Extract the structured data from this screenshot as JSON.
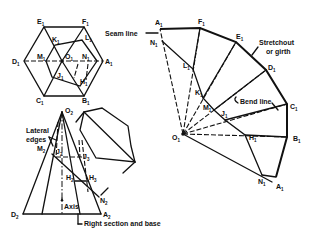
{
  "figure": {
    "top_view": {
      "vertices": [
        "A1",
        "B1",
        "C1",
        "D1",
        "E1",
        "F1"
      ],
      "center": "O1",
      "cut_points": [
        "H1",
        "J1",
        "K1",
        "L1",
        "M1",
        "N1"
      ]
    },
    "front_view": {
      "apex": "O2",
      "base_left": "D2",
      "base_right": "A2",
      "points": [
        "M2",
        "J2",
        "J3",
        "H2",
        "H3",
        "N2"
      ],
      "annotations": {
        "lateral_edges": "Lateral edges",
        "axis": "Axis",
        "right_section": "Right section and base"
      }
    },
    "development": {
      "apex": "O1",
      "arc_points": [
        "A1",
        "F1",
        "E1",
        "D1",
        "C1",
        "B1",
        "A1"
      ],
      "cut_points": [
        "N1",
        "L1",
        "K1",
        "M1",
        "J1",
        "H1",
        "N1"
      ],
      "annotations": {
        "seam_line": "Seam line",
        "stretchout_line1": "Stretchout",
        "stretchout_line2": "or girth",
        "bend_line": "Bend line"
      }
    }
  },
  "labels": {
    "top": {
      "E": "E",
      "E_sub": "1",
      "F": "F",
      "F_sub": "1",
      "K": "K",
      "K_sub": "1",
      "L": "L",
      "L_sub": "1",
      "M": "M",
      "M_sub": "1",
      "O": "O",
      "O_sub": "1",
      "N": "N",
      "N_sub": "1",
      "D": "D",
      "D_sub": "1",
      "A": "A",
      "A_sub": "1",
      "J": "J",
      "J_sub": "1",
      "H": "H",
      "H_sub": "1",
      "C": "C",
      "C_sub": "1",
      "B": "B",
      "B_sub": "1"
    },
    "front": {
      "O": "O",
      "O_sub": "2",
      "M": "M",
      "M_sub": "2",
      "J2": "J",
      "J2_sub": "2",
      "J3": "J",
      "J3_sub": "3",
      "H2": "H",
      "H2_sub": "2",
      "H3": "H",
      "H3_sub": "3",
      "N": "N",
      "N_sub": "2",
      "D": "D",
      "D_sub": "2",
      "A": "A",
      "A_sub": "2",
      "lateral1": "Lateral",
      "lateral2": "edges",
      "axis": "Axis",
      "right_section": "Right section and base"
    },
    "dev": {
      "A_top": "A",
      "A_top_sub": "1",
      "F": "F",
      "F_sub": "1",
      "E": "E",
      "E_sub": "1",
      "D": "D",
      "D_sub": "1",
      "C": "C",
      "C_sub": "1",
      "B": "B",
      "B_sub": "1",
      "A_bot": "A",
      "A_bot_sub": "1",
      "N_top": "N",
      "N_top_sub": "1",
      "L": "L",
      "L_sub": "1",
      "K": "K",
      "K_sub": "1",
      "M": "M",
      "M_sub": "1",
      "J": "J",
      "J_sub": "1",
      "H": "H",
      "H_sub": "1",
      "N_bot": "N",
      "N_bot_sub": "1",
      "O": "O",
      "O_sub": "1",
      "seam": "Seam line",
      "stretch1": "Stretchout",
      "stretch2": "or girth",
      "bend": "Bend line"
    }
  }
}
